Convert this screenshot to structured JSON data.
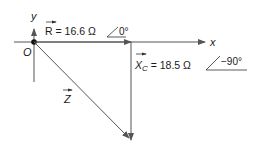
{
  "diagram": {
    "type": "phasor-diagram",
    "axes": {
      "x_label": "x",
      "y_label": "y",
      "origin_label": "O"
    },
    "phasors": [
      {
        "name": "R",
        "label": "R = 16.6 Ω",
        "angle": "0°",
        "direction": "along +x"
      },
      {
        "name": "X_C",
        "label_main": "X",
        "label_sub": "C",
        "label_value": " = 18.5 Ω",
        "angle": "−90°",
        "direction": "downward"
      },
      {
        "name": "Z",
        "label": "Z",
        "direction": "origin to tip of X_C"
      }
    ],
    "colors": {
      "line": "#555555",
      "text": "#1a1a1a"
    }
  }
}
